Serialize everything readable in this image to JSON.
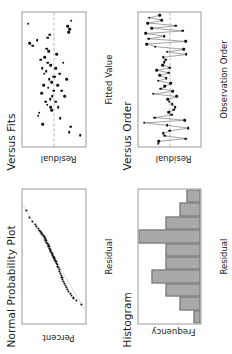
{
  "figure": {
    "background_color": "#ffffff",
    "marker_color": "#111111",
    "line_color": "#8c8c8c",
    "bar_fill_color": "#a9a9a9",
    "bar_edge_color": "#6f6f6f",
    "axis_color": "#9a9a9a",
    "reference_line_color": "#b9b9b9"
  },
  "panels": {
    "normal_probability_plot": {
      "title": "Normal Probability Plot",
      "xlabel": "Residual",
      "ylabel": "Percent",
      "xticks": [
        "-1.0",
        "-0.5",
        "0.0",
        "0.5",
        "1.0"
      ],
      "yticks": [
        "99",
        "90",
        "50",
        "10",
        "1"
      ]
    },
    "versus_fits": {
      "title": "Versus Fits",
      "xlabel": "Fitted Value",
      "ylabel": "Residual",
      "xticks": [
        "89",
        "90",
        "91",
        "92",
        "93"
      ],
      "yticks": [
        "0.8",
        "0.4",
        "0.0",
        "-0.4",
        "-0.8"
      ]
    },
    "histogram": {
      "title": "Histogram",
      "xlabel": "Residual",
      "ylabel": "Frequency",
      "xticks": [
        "-0.6",
        "-0.3",
        "0.0",
        "0.3",
        "0.6"
      ],
      "yticks": [
        "0",
        "2",
        "4",
        "6",
        "8"
      ]
    },
    "versus_order": {
      "title": "Versus Order",
      "xlabel": "Observation Order",
      "ylabel": "Residual",
      "xticks": [
        "1",
        "5",
        "10",
        "15",
        "20",
        "25",
        "30",
        "35",
        "40",
        "45",
        "50"
      ],
      "yticks": [
        "0.8",
        "0.4",
        "0.0",
        "-0.4",
        "-0.8"
      ]
    }
  },
  "chart_data": [
    {
      "id": "normal_probability_plot",
      "type": "scatter",
      "title": "Normal Probability Plot",
      "xlabel": "Residual",
      "ylabel": "Percent",
      "xlim": [
        -1.0,
        1.0
      ],
      "ylim_percent": [
        1,
        99
      ],
      "yscale": "normal-probability",
      "grid": false,
      "legend": "none",
      "reference_line": {
        "type": "fitted-normal-line",
        "visible": true
      },
      "x": [
        -0.72,
        -0.66,
        -0.62,
        -0.58,
        -0.55,
        -0.52,
        -0.49,
        -0.46,
        -0.44,
        -0.41,
        -0.38,
        -0.35,
        -0.32,
        -0.29,
        -0.26,
        -0.23,
        -0.2,
        -0.17,
        -0.15,
        -0.12,
        -0.1,
        -0.08,
        -0.06,
        -0.04,
        -0.02,
        0.0,
        0.02,
        0.04,
        0.06,
        0.08,
        0.1,
        0.12,
        0.15,
        0.17,
        0.19,
        0.21,
        0.24,
        0.26,
        0.29,
        0.31,
        0.33,
        0.35,
        0.37,
        0.39,
        0.42,
        0.45,
        0.48,
        0.52,
        0.58,
        0.68
      ],
      "percent": [
        1.4,
        3.4,
        5.4,
        7.4,
        9.4,
        11.4,
        13.4,
        15.4,
        17.4,
        19.4,
        21.4,
        23.4,
        25.4,
        27.4,
        29.4,
        31.4,
        33.4,
        35.4,
        37.4,
        39.4,
        41.4,
        43.4,
        45.4,
        47.4,
        49.4,
        51.4,
        53.4,
        55.4,
        57.4,
        59.4,
        61.4,
        63.4,
        65.4,
        67.4,
        69.4,
        71.4,
        73.4,
        75.4,
        77.4,
        79.4,
        81.4,
        83.4,
        85.4,
        87.4,
        89.4,
        91.4,
        93.4,
        95.4,
        97.4,
        98.6
      ]
    },
    {
      "id": "versus_fits",
      "type": "scatter",
      "title": "Versus Fits",
      "xlabel": "Fitted Value",
      "ylabel": "Residual",
      "xlim": [
        88.6,
        93.4
      ],
      "ylim": [
        -0.85,
        0.85
      ],
      "grid": false,
      "legend": "none",
      "reference_line": {
        "type": "horizontal-zero",
        "value": 0.0,
        "visible": true
      },
      "x": [
        89.0,
        89.1,
        89.3,
        89.4,
        89.6,
        89.7,
        89.8,
        89.9,
        90.0,
        90.0,
        90.1,
        90.2,
        90.2,
        90.3,
        90.4,
        90.4,
        90.5,
        90.6,
        90.6,
        90.7,
        90.8,
        90.8,
        90.9,
        91.0,
        91.0,
        91.1,
        91.1,
        91.2,
        91.2,
        91.3,
        91.4,
        91.4,
        91.5,
        91.6,
        91.6,
        91.7,
        91.8,
        91.9,
        92.0,
        92.1,
        92.2,
        92.3,
        92.4,
        92.5,
        92.6,
        92.7,
        92.8,
        92.9,
        93.0,
        93.1
      ],
      "y": [
        -0.72,
        -0.42,
        -0.46,
        0.3,
        -0.18,
        0.42,
        0.4,
        0.05,
        0.08,
        -0.12,
        0.18,
        0.22,
        -0.05,
        0.1,
        0.04,
        -0.3,
        0.33,
        0.0,
        -0.22,
        0.15,
        -0.1,
        0.28,
        0.06,
        -0.36,
        0.12,
        0.02,
        -0.02,
        0.26,
        -0.16,
        0.2,
        0.31,
        -0.06,
        0.09,
        -0.26,
        0.17,
        0.35,
        0.24,
        -0.08,
        0.13,
        0.19,
        0.58,
        0.66,
        0.45,
        0.16,
        0.11,
        -0.4,
        -0.44,
        -0.38,
        0.7,
        -0.48
      ]
    },
    {
      "id": "histogram",
      "type": "bar",
      "title": "Histogram",
      "xlabel": "Residual",
      "ylabel": "Frequency",
      "xlim": [
        -0.75,
        0.75
      ],
      "ylim": [
        0,
        9
      ],
      "grid": false,
      "legend": "none",
      "bin_centers": [
        -0.675,
        -0.525,
        -0.375,
        -0.225,
        -0.075,
        0.075,
        0.225,
        0.375,
        0.525,
        0.675
      ],
      "bin_width": 0.15,
      "values": [
        1,
        3,
        5,
        7,
        5,
        5,
        9,
        5,
        3,
        2
      ]
    },
    {
      "id": "versus_order",
      "type": "line",
      "title": "Versus Order",
      "xlabel": "Observation Order",
      "ylabel": "Residual",
      "xlim": [
        0,
        51
      ],
      "ylim": [
        -0.85,
        0.85
      ],
      "grid": false,
      "legend": "none",
      "markers": true,
      "reference_line": {
        "type": "horizontal-zero",
        "value": 0.0,
        "visible": true
      },
      "x": [
        1,
        2,
        3,
        4,
        5,
        6,
        7,
        8,
        9,
        10,
        11,
        12,
        13,
        14,
        15,
        16,
        17,
        18,
        19,
        20,
        21,
        22,
        23,
        24,
        25,
        26,
        27,
        28,
        29,
        30,
        31,
        32,
        33,
        34,
        35,
        36,
        37,
        38,
        39,
        40,
        41,
        42,
        43,
        44,
        45,
        46,
        47,
        48,
        49,
        50
      ],
      "y": [
        0.3,
        0.28,
        -0.45,
        0.12,
        0.16,
        -0.02,
        -0.52,
        0.06,
        0.68,
        -0.42,
        0.4,
        -0.06,
        0.02,
        -0.12,
        -0.16,
        -0.08,
        0.0,
        0.05,
        -0.2,
        0.44,
        -0.1,
        0.24,
        0.12,
        -0.04,
        0.3,
        0.08,
        0.26,
        0.02,
        0.34,
        -0.02,
        0.18,
        0.14,
        0.1,
        0.16,
        -0.46,
        0.06,
        -0.4,
        0.38,
        0.62,
        -0.44,
        0.56,
        0.14,
        0.64,
        -0.36,
        0.48,
        -0.18,
        0.58,
        0.2,
        0.54,
        0.26
      ]
    }
  ]
}
